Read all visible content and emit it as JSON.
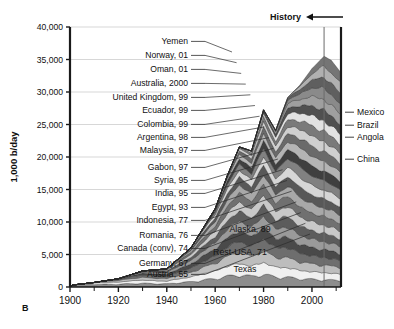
{
  "figure": {
    "panel_label": "B",
    "history_label": "History",
    "history_arrow": "left-arrow"
  },
  "chart_data": {
    "type": "area",
    "title": "",
    "subtitle": "",
    "xlabel": "",
    "ylabel": "1,000 b/day",
    "xlim": [
      1900,
      2012
    ],
    "ylim": [
      0,
      40000
    ],
    "grid": true,
    "legend_position": "inline-annotations",
    "x_ticks_major": [
      1900,
      1920,
      1940,
      1960,
      1980,
      2000
    ],
    "x_ticks_minor": [
      1910,
      1930,
      1950,
      1970,
      1990,
      2010
    ],
    "x_tick_labels": [
      "1900",
      "1920",
      "1940",
      "1960",
      "1980",
      "2000"
    ],
    "y_ticks": [
      0,
      5000,
      10000,
      15000,
      20000,
      25000,
      30000,
      35000,
      40000
    ],
    "y_tick_labels": [
      "0",
      "5,000",
      "10,000",
      "15,000",
      "20,000",
      "25,000",
      "30,000",
      "35,000",
      "40,000"
    ],
    "present_marker_year": 2005,
    "x": [
      1900,
      1910,
      1920,
      1930,
      1940,
      1950,
      1960,
      1965,
      1970,
      1975,
      1980,
      1985,
      1990,
      1995,
      2000,
      2005,
      2008,
      2012
    ],
    "total_values": [
      400,
      1100,
      2000,
      3900,
      4400,
      9500,
      19000,
      27000,
      34000,
      33000,
      43000,
      38000,
      46000,
      49000,
      53000,
      56000,
      55000,
      52000
    ],
    "peak_total": 35500,
    "peak_year": 2005,
    "series": [
      {
        "name": "Texas",
        "peak_year": "",
        "label": "Texas",
        "color": "#8d8d8d"
      },
      {
        "name": "Rest-USA, 71",
        "peak_year": "71",
        "label": "Rest-USA, 71",
        "color": "#f0f0f0"
      },
      {
        "name": "Alaska, 89",
        "peak_year": "89",
        "label": "Alaska, 89",
        "color": "#bdbdbd"
      },
      {
        "name": "Austria, 55",
        "peak_year": "55",
        "label": "Austria, 55",
        "color": "#6e6e6e"
      },
      {
        "name": "Germany, 67",
        "peak_year": "67",
        "label": "Germany, 67",
        "color": "#4a4a4a"
      },
      {
        "name": "Canada (conv), 74",
        "peak_year": "74",
        "label": "Canada (conv), 74",
        "color": "#9a9a9a"
      },
      {
        "name": "Romania, 76",
        "peak_year": "76",
        "label": "Romania, 76",
        "color": "#5c5c5c"
      },
      {
        "name": "Indonesia, 77",
        "peak_year": "77",
        "label": "Indonesia, 77",
        "color": "#c8c8c8"
      },
      {
        "name": "Egypt, 93",
        "peak_year": "93",
        "label": "Egypt, 93",
        "color": "#707070"
      },
      {
        "name": "India, 95",
        "peak_year": "95",
        "label": "India, 95",
        "color": "#a8a8a8"
      },
      {
        "name": "Syria, 95",
        "peak_year": "95",
        "label": "Syria, 95",
        "color": "#585858"
      },
      {
        "name": "Gabon, 97",
        "peak_year": "97",
        "label": "Gabon, 97",
        "color": "#d6d6d6"
      },
      {
        "name": "Malaysia, 97",
        "peak_year": "97",
        "label": "Malaysia, 97",
        "color": "#818181"
      },
      {
        "name": "Argentina, 98",
        "peak_year": "98",
        "label": "Argentina, 98",
        "color": "#3f3f3f"
      },
      {
        "name": "Colombia, 99",
        "peak_year": "99",
        "label": "Colombia, 99",
        "color": "#b4b4b4"
      },
      {
        "name": "Ecuador, 99",
        "peak_year": "99",
        "label": "Ecuador, 99",
        "color": "#6a6a6a"
      },
      {
        "name": "United Kingdom, 99",
        "peak_year": "99",
        "label": "United Kingdom, 99",
        "color": "#cfcfcf"
      },
      {
        "name": "Australia, 2000",
        "peak_year": "2000",
        "label": "Australia, 2000",
        "color": "#7a7a7a"
      },
      {
        "name": "Oman, 01",
        "peak_year": "01",
        "label": "Oman, 01",
        "color": "#e2e2e2"
      },
      {
        "name": "Norway, 01",
        "peak_year": "01",
        "label": "Norway, 01",
        "color": "#505050"
      },
      {
        "name": "Yemen",
        "peak_year": "",
        "label": "Yemen",
        "color": "#9f9f9f"
      },
      {
        "name": "Mexico",
        "peak_year": "",
        "label": "Mexico",
        "color": "#8a8a8a"
      },
      {
        "name": "Brazil",
        "peak_year": "",
        "label": "Brazil",
        "color": "#5f5f5f"
      },
      {
        "name": "Angola",
        "peak_year": "",
        "label": "Angola",
        "color": "#b0b0b0"
      },
      {
        "name": "China",
        "peak_year": "",
        "label": "China",
        "color": "#757575"
      }
    ],
    "left_annotations": [
      {
        "label": "Yemen",
        "y": 44
      },
      {
        "label": "Norway, 01",
        "y": 58
      },
      {
        "label": "Oman, 01",
        "y": 72
      },
      {
        "label": "Australia, 2000",
        "y": 86
      },
      {
        "label": "United Kingdom, 99",
        "y": 100
      },
      {
        "label": "Ecuador, 99",
        "y": 113
      },
      {
        "label": "Colombia, 99",
        "y": 127
      },
      {
        "label": "Argentina, 98",
        "y": 140
      },
      {
        "label": "Malaysia, 97",
        "y": 153
      },
      {
        "label": "Gabon, 97",
        "y": 170
      },
      {
        "label": "Syria, 95",
        "y": 183
      },
      {
        "label": "India, 95",
        "y": 196
      },
      {
        "label": "Egypt, 93",
        "y": 210
      },
      {
        "label": "Indonesia, 77",
        "y": 223
      },
      {
        "label": "Romania, 76",
        "y": 238
      },
      {
        "label": "Canada (conv), 74",
        "y": 251
      },
      {
        "label": "Germany, 67",
        "y": 266
      },
      {
        "label": "Austria, 55",
        "y": 277
      }
    ],
    "right_annotations": [
      {
        "label": "Mexico",
        "y": 115
      },
      {
        "label": "Brazil",
        "y": 128
      },
      {
        "label": "Angola",
        "y": 140
      },
      {
        "label": "China",
        "y": 162
      }
    ],
    "inline_annotations": [
      {
        "label": "Alaska, 89",
        "x": 250,
        "y": 232
      },
      {
        "label": "Rest-USA, 71",
        "x": 240,
        "y": 255
      },
      {
        "label": "Texas",
        "x": 245,
        "y": 272
      }
    ]
  },
  "colors": {
    "axis": "#1a1a1a",
    "grid": "#cdcdcd",
    "text": "#111111",
    "background": "#ffffff",
    "marker_line": "#666666"
  }
}
